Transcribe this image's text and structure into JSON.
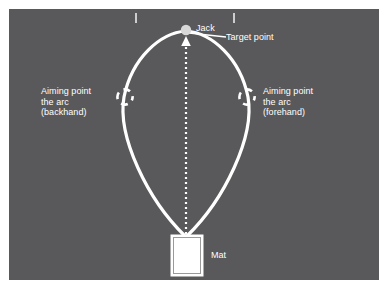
{
  "figure": {
    "panel_color": "#59595b",
    "line_color": "#ffffff",
    "text_color": "#ffffff",
    "mat_fill": "#ffffff"
  },
  "labels": {
    "jack": "Jack",
    "target_point": "Target point",
    "aiming_backhand": "Aiming point\nthe arc\n(backhand)",
    "aiming_forehand": "Aiming point\nthe arc\n(forehand)",
    "mat": "Mat"
  },
  "markers": {
    "jack_marker": "filled-circle",
    "aiming_marker": "dashed-circle",
    "direction_marker": "up-arrowhead",
    "centre_line": "dotted-line",
    "boundary_ticks": "rink-boundary-tick"
  },
  "geometry": {
    "jack": {
      "x": 186,
      "y": 30,
      "r": 5
    },
    "mat": {
      "x": 171,
      "y": 235,
      "w": 32,
      "h": 41
    },
    "aiming_backhand": {
      "x": 125,
      "y": 97,
      "r": 8
    },
    "aiming_forehand": {
      "x": 247,
      "y": 97,
      "r": 8
    },
    "ticks": [
      {
        "x": 136,
        "y1": 13,
        "y2": 23
      },
      {
        "x": 234,
        "y1": 13,
        "y2": 23
      }
    ]
  }
}
